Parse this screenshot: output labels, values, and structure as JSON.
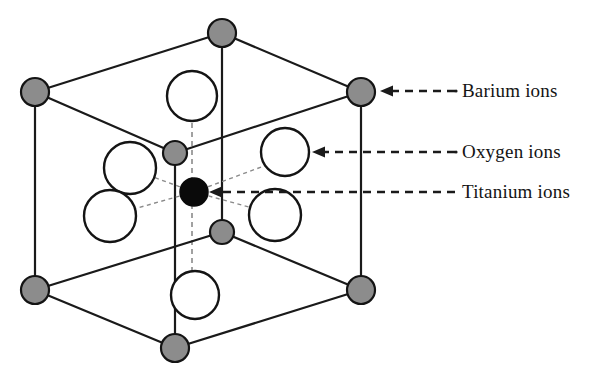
{
  "figure": {
    "name": "barium-titanate-unit-cell",
    "background_color": "#ffffff"
  },
  "callouts": [
    {
      "id": "barium",
      "label": "Barium ions",
      "species": "Ba",
      "marker": "gray-filled-circle",
      "color": "#8c8c8c",
      "arrow_from_x": 455,
      "arrow_to_x": 382,
      "arrow_y": 91
    },
    {
      "id": "oxygen",
      "label": "Oxygen ions",
      "species": "O",
      "marker": "white-open-circle",
      "color": "#ffffff",
      "arrow_from_x": 455,
      "arrow_to_x": 314,
      "arrow_y": 152
    },
    {
      "id": "titanium",
      "label": "Titanium ions",
      "species": "Ti",
      "marker": "black-filled-circle",
      "color": "#0a0a0a",
      "arrow_from_x": 455,
      "arrow_to_x": 212,
      "arrow_y": 192
    }
  ],
  "structure": {
    "lattice_type": "perovskite-cubic-unit-cell",
    "corner_atoms": {
      "species": "Barium",
      "color": "#8c8c8c",
      "radius": 14,
      "positions": [
        {
          "name": "top-back",
          "x": 222,
          "y": 33
        },
        {
          "name": "top-left-front",
          "x": 35,
          "y": 92
        },
        {
          "name": "top-right-front",
          "x": 361,
          "y": 92
        },
        {
          "name": "bottom-left-front",
          "x": 35,
          "y": 290
        },
        {
          "name": "bottom-right-front",
          "x": 361,
          "y": 290
        },
        {
          "name": "bottom-front",
          "x": 175,
          "y": 348
        }
      ]
    },
    "mid_atoms": {
      "species": "Barium",
      "color": "#8c8c8c",
      "radius": 12,
      "positions": [
        {
          "name": "mid-upper",
          "x": 175,
          "y": 153
        },
        {
          "name": "mid-lower",
          "x": 222,
          "y": 232
        }
      ]
    },
    "oxygen_atoms": {
      "species": "Oxygen",
      "color": "#ffffff",
      "positions": [
        {
          "name": "face-top",
          "x": 192,
          "y": 96,
          "r": 25
        },
        {
          "name": "face-left-upper",
          "x": 130,
          "y": 168,
          "r": 26
        },
        {
          "name": "face-left-lower",
          "x": 110,
          "y": 216,
          "r": 26
        },
        {
          "name": "face-right-upper",
          "x": 285,
          "y": 152,
          "r": 24
        },
        {
          "name": "face-right-lower",
          "x": 275,
          "y": 215,
          "r": 26
        },
        {
          "name": "face-bottom",
          "x": 195,
          "y": 295,
          "r": 24
        }
      ]
    },
    "center_atom": {
      "species": "Titanium",
      "color": "#0a0a0a",
      "x": 194,
      "y": 192,
      "r": 14
    },
    "solid_edges": [
      {
        "x1": 222,
        "y1": 33,
        "x2": 35,
        "y2": 92
      },
      {
        "x1": 222,
        "y1": 33,
        "x2": 361,
        "y2": 92
      },
      {
        "x1": 222,
        "y1": 33,
        "x2": 222,
        "y2": 232
      },
      {
        "x1": 35,
        "y1": 92,
        "x2": 35,
        "y2": 290
      },
      {
        "x1": 361,
        "y1": 92,
        "x2": 361,
        "y2": 290
      },
      {
        "x1": 35,
        "y1": 92,
        "x2": 175,
        "y2": 153
      },
      {
        "x1": 175,
        "y1": 153,
        "x2": 361,
        "y2": 92
      },
      {
        "x1": 175,
        "y1": 153,
        "x2": 175,
        "y2": 348
      },
      {
        "x1": 35,
        "y1": 290,
        "x2": 175,
        "y2": 348
      },
      {
        "x1": 175,
        "y1": 348,
        "x2": 361,
        "y2": 290
      },
      {
        "x1": 35,
        "y1": 290,
        "x2": 222,
        "y2": 232
      },
      {
        "x1": 222,
        "y1": 232,
        "x2": 361,
        "y2": 290
      }
    ],
    "hidden_edges": [
      {
        "x1": 192,
        "y1": 96,
        "x2": 192,
        "y2": 295
      }
    ],
    "bonds": [
      {
        "x1": 194,
        "y1": 192,
        "x2": 130,
        "y2": 168
      },
      {
        "x1": 194,
        "y1": 192,
        "x2": 110,
        "y2": 216
      },
      {
        "x1": 194,
        "y1": 192,
        "x2": 285,
        "y2": 152
      },
      {
        "x1": 194,
        "y1": 192,
        "x2": 275,
        "y2": 215
      }
    ]
  }
}
